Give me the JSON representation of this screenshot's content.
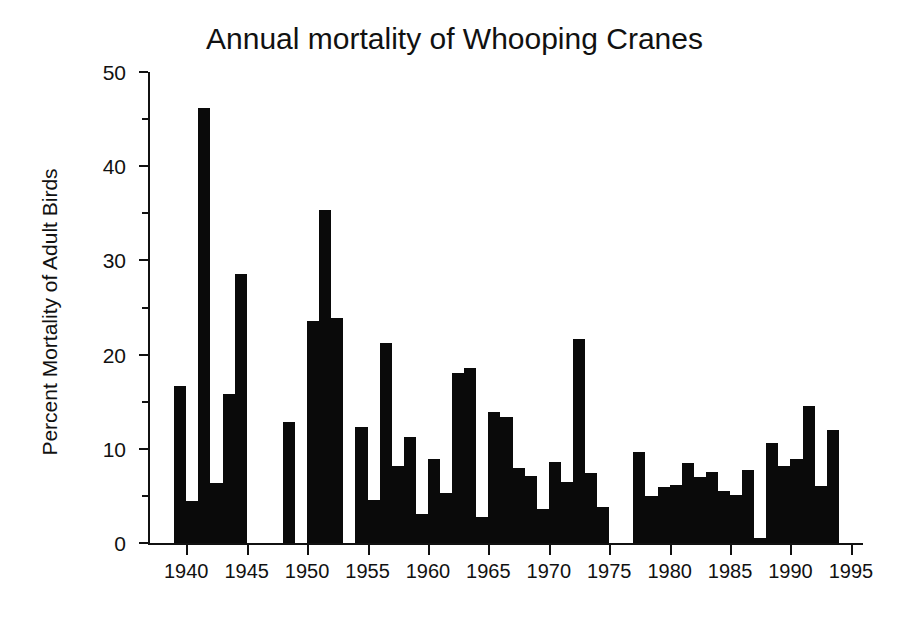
{
  "chart_data": {
    "type": "bar",
    "title": "Annual mortality of Whooping Cranes",
    "xlabel": "",
    "ylabel": "Percent Mortality of Adult Birds",
    "xlim": [
      1937,
      1996
    ],
    "ylim": [
      0,
      50
    ],
    "grid": false,
    "legend": null,
    "y_ticks_major": [
      0,
      10,
      20,
      30,
      40,
      50
    ],
    "y_ticks_minor": [
      5,
      15,
      25,
      35,
      45
    ],
    "y_tick_labels": [
      "0",
      "10",
      "20",
      "30",
      "40",
      "50"
    ],
    "x_ticks_major": [
      1940,
      1945,
      1950,
      1955,
      1960,
      1965,
      1970,
      1975,
      1980,
      1985,
      1990,
      1995
    ],
    "x_tick_labels": [
      "1940",
      "1945",
      "1950",
      "1955",
      "1960",
      "1965",
      "1970",
      "1975",
      "1980",
      "1985",
      "1990",
      "1995"
    ],
    "bar_color": "#0a0a0a",
    "categories": [
      1939,
      1940,
      1941,
      1942,
      1943,
      1944,
      1948,
      1949,
      1950,
      1951,
      1952,
      1954,
      1955,
      1956,
      1957,
      1958,
      1959,
      1960,
      1961,
      1962,
      1963,
      1964,
      1965,
      1966,
      1967,
      1968,
      1969,
      1970,
      1971,
      1972,
      1973,
      1974,
      1977,
      1978,
      1979,
      1980,
      1981,
      1982,
      1983,
      1984,
      1985,
      1986,
      1987,
      1988,
      1989,
      1990,
      1991,
      1992,
      1993
    ],
    "values": [
      16.7,
      4.5,
      46.2,
      6.4,
      15.8,
      28.6,
      12.8,
      0,
      23.6,
      35.4,
      23.9,
      12.3,
      4.6,
      21.2,
      8.2,
      11.3,
      3.1,
      8.9,
      5.3,
      18.0,
      18.6,
      2.8,
      13.9,
      13.4,
      8.0,
      7.1,
      3.6,
      8.6,
      6.5,
      21.7,
      7.4,
      3.8,
      9.7,
      5.0,
      5.9,
      6.2,
      8.5,
      7.0,
      7.5,
      5.5,
      5.1,
      7.8,
      0.5,
      10.6,
      8.2,
      8.9,
      14.5,
      6.1,
      12.0
    ]
  },
  "axis": {
    "y_axis_name": "y-axis",
    "x_axis_name": "x-axis"
  }
}
